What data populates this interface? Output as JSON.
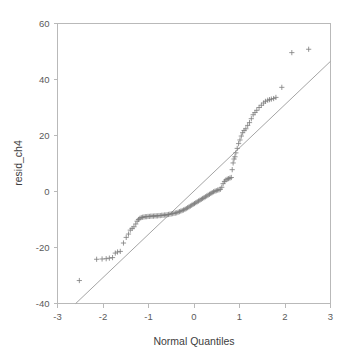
{
  "chart_data": {
    "type": "scatter",
    "title": "",
    "subtitle": "",
    "xlabel": "Normal Quantiles",
    "ylabel": "resid_ch4",
    "xlim": [
      -3,
      3
    ],
    "ylim": [
      -40,
      60
    ],
    "xticks": [
      -3,
      -2,
      -1,
      0,
      1,
      2,
      3
    ],
    "xtick_labels": [
      "-3",
      "-2",
      "-1",
      "0",
      "1",
      "2",
      "3"
    ],
    "yticks": [
      -40,
      -20,
      0,
      20,
      40,
      60
    ],
    "ytick_labels": [
      "-40",
      "-20",
      "0",
      "20",
      "40",
      "60"
    ],
    "grid": false,
    "legend": null,
    "marker": "plus",
    "marker_color": "#7c7c7c",
    "line_color": "#9a9a9a",
    "frame_color": "#b9b9b9",
    "background": "#ffffff",
    "reference_line": {
      "name": "normal-reference-line",
      "x1": -2.6,
      "y1": -40.0,
      "x2": 3.0,
      "y2": 46.5,
      "slope": 15.45,
      "intercept": -0.17
    },
    "series": [
      {
        "name": "resid_ch4 quantiles",
        "points": [
          [
            -2.52,
            -31.8
          ],
          [
            -2.14,
            -24.2
          ],
          [
            -2.02,
            -24.1
          ],
          [
            -1.93,
            -24.0
          ],
          [
            -1.86,
            -23.8
          ],
          [
            -1.79,
            -23.6
          ],
          [
            -1.73,
            -22.0
          ],
          [
            -1.68,
            -21.6
          ],
          [
            -1.62,
            -21.4
          ],
          [
            -1.55,
            -18.4
          ],
          [
            -1.49,
            -16.4
          ],
          [
            -1.44,
            -15.2
          ],
          [
            -1.4,
            -13.8
          ],
          [
            -1.36,
            -13.2
          ],
          [
            -1.32,
            -12.6
          ],
          [
            -1.28,
            -11.6
          ],
          [
            -1.25,
            -10.6
          ],
          [
            -1.22,
            -10.0
          ],
          [
            -1.19,
            -9.6
          ],
          [
            -1.16,
            -9.3
          ],
          [
            -1.13,
            -9.2
          ],
          [
            -1.1,
            -9.1
          ],
          [
            -1.07,
            -9.0
          ],
          [
            -1.04,
            -9.0
          ],
          [
            -1.01,
            -8.9
          ],
          [
            -0.98,
            -8.9
          ],
          [
            -0.95,
            -8.8
          ],
          [
            -0.92,
            -8.8
          ],
          [
            -0.89,
            -8.8
          ],
          [
            -0.86,
            -8.7
          ],
          [
            -0.83,
            -8.7
          ],
          [
            -0.8,
            -8.7
          ],
          [
            -0.77,
            -8.6
          ],
          [
            -0.74,
            -8.6
          ],
          [
            -0.71,
            -8.5
          ],
          [
            -0.68,
            -8.5
          ],
          [
            -0.65,
            -8.4
          ],
          [
            -0.62,
            -8.4
          ],
          [
            -0.59,
            -8.3
          ],
          [
            -0.56,
            -8.2
          ],
          [
            -0.53,
            -8.1
          ],
          [
            -0.5,
            -8.0
          ],
          [
            -0.47,
            -7.9
          ],
          [
            -0.44,
            -7.8
          ],
          [
            -0.41,
            -7.7
          ],
          [
            -0.38,
            -7.6
          ],
          [
            -0.35,
            -7.4
          ],
          [
            -0.32,
            -7.2
          ],
          [
            -0.29,
            -7.0
          ],
          [
            -0.26,
            -6.8
          ],
          [
            -0.23,
            -6.6
          ],
          [
            -0.2,
            -6.4
          ],
          [
            -0.17,
            -6.1
          ],
          [
            -0.14,
            -5.8
          ],
          [
            -0.11,
            -5.5
          ],
          [
            -0.08,
            -5.2
          ],
          [
            -0.05,
            -4.9
          ],
          [
            -0.02,
            -4.6
          ],
          [
            0.01,
            -4.3
          ],
          [
            0.04,
            -4.0
          ],
          [
            0.07,
            -3.7
          ],
          [
            0.1,
            -3.4
          ],
          [
            0.13,
            -3.1
          ],
          [
            0.16,
            -2.8
          ],
          [
            0.19,
            -2.5
          ],
          [
            0.22,
            -2.2
          ],
          [
            0.25,
            -1.9
          ],
          [
            0.28,
            -1.6
          ],
          [
            0.31,
            -1.3
          ],
          [
            0.34,
            -1.0
          ],
          [
            0.37,
            -0.7
          ],
          [
            0.4,
            -0.4
          ],
          [
            0.43,
            -0.1
          ],
          [
            0.46,
            0.1
          ],
          [
            0.49,
            0.3
          ],
          [
            0.52,
            0.5
          ],
          [
            0.55,
            0.6
          ],
          [
            0.58,
            0.8
          ],
          [
            0.61,
            1.5
          ],
          [
            0.64,
            2.8
          ],
          [
            0.67,
            3.6
          ],
          [
            0.7,
            4.1
          ],
          [
            0.73,
            4.4
          ],
          [
            0.76,
            4.6
          ],
          [
            0.79,
            4.8
          ],
          [
            0.82,
            5.0
          ],
          [
            0.84,
            7.8
          ],
          [
            0.86,
            10.2
          ],
          [
            0.88,
            11.6
          ],
          [
            0.9,
            12.4
          ],
          [
            0.92,
            13.8
          ],
          [
            0.95,
            15.4
          ],
          [
            0.98,
            17.1
          ],
          [
            1.01,
            18.4
          ],
          [
            1.04,
            19.8
          ],
          [
            1.07,
            21.0
          ],
          [
            1.1,
            21.8
          ],
          [
            1.14,
            22.4
          ],
          [
            1.18,
            23.6
          ],
          [
            1.22,
            24.6
          ],
          [
            1.26,
            26.0
          ],
          [
            1.3,
            27.4
          ],
          [
            1.34,
            28.2
          ],
          [
            1.38,
            29.0
          ],
          [
            1.43,
            30.0
          ],
          [
            1.48,
            30.8
          ],
          [
            1.53,
            31.6
          ],
          [
            1.57,
            32.2
          ],
          [
            1.62,
            32.6
          ],
          [
            1.66,
            32.8
          ],
          [
            1.7,
            33.0
          ],
          [
            1.75,
            33.2
          ],
          [
            1.8,
            33.6
          ],
          [
            1.93,
            37.2
          ],
          [
            2.15,
            49.6
          ],
          [
            2.52,
            50.8
          ]
        ]
      }
    ]
  },
  "axes": {
    "x_title": "Normal Quantiles",
    "y_title": "resid_ch4"
  }
}
